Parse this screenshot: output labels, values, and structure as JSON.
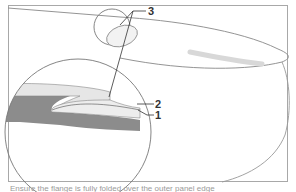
{
  "diagram": {
    "callouts": [
      {
        "id": "1",
        "label": "1"
      },
      {
        "id": "2",
        "label": "2"
      },
      {
        "id": "3",
        "label": "3"
      }
    ],
    "colors": {
      "frame": "#a8a8a8",
      "outline": "#7a7a7a",
      "dark_layer": "#8c8c8c",
      "light_layer": "#e6e6e6",
      "leader": "#333333"
    }
  },
  "caption": {
    "text": "Ensure the flange is fully folded over the outer panel edge"
  }
}
